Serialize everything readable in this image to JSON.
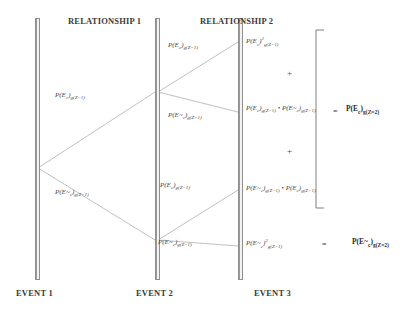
{
  "diagram": {
    "title_headers": [
      {
        "label": "RELATIONSHIP 1",
        "x": 68,
        "y": 16
      },
      {
        "label": "RELATIONSHIP 2",
        "x": 200,
        "y": 16
      }
    ],
    "footers": [
      {
        "label": "EVENT 1",
        "x": 16,
        "y": 288
      },
      {
        "label": "EVENT 2",
        "x": 136,
        "y": 288
      },
      {
        "label": "EVENT 3",
        "x": 254,
        "y": 288
      }
    ],
    "bars": [
      {
        "name": "event-1-bar",
        "x": 35,
        "y": 18,
        "height": 262
      },
      {
        "name": "event-2-bar",
        "x": 155,
        "y": 18,
        "height": 262
      },
      {
        "name": "event-3-bar",
        "x": 238,
        "y": 18,
        "height": 262
      }
    ],
    "branch_labels": [
      {
        "name": "branch-label-upper-rel1",
        "text_html": "P(E<sub>c</sub>)<sub>g(Z=1)</sub>",
        "x": 55,
        "y": 92
      },
      {
        "name": "branch-label-lower-rel1",
        "text_html": "P(E~<sub>c</sub>)<sub>g(Z=1)</sub>",
        "x": 55,
        "y": 189
      },
      {
        "name": "branch-label-upper-upper-rel2",
        "text_html": "P(E<sub>c</sub>)<sub>g(Z=1)</sub>",
        "x": 168,
        "y": 42
      },
      {
        "name": "branch-label-upper-lower-rel2",
        "text_html": "P(E~<sub>c</sub>)<sub>g(Z=1)</sub>",
        "x": 168,
        "y": 112
      },
      {
        "name": "branch-label-lower-upper-rel2",
        "text_html": "P(E<sub>c</sub>)<sub>g(Z=1)</sub>",
        "x": 160,
        "y": 182
      },
      {
        "name": "branch-label-lower-lower-rel2",
        "text_html": "P(E~<sub>c</sub>)<sub>g(Z=1)</sub>",
        "x": 158,
        "y": 239
      }
    ],
    "outcome_terms": [
      {
        "name": "outcome-term-1",
        "text_html": "P(E<sub>c</sub>)<sup>2</sup><sub>g(Z=1)</sub>",
        "x": 246,
        "y": 36
      },
      {
        "name": "outcome-term-2",
        "text_html": "P(E<sub>c</sub>)<sub>g(Z=1)</sub> &bull; P(E~<sub>c</sub>)<sub>g(Z=1)</sub>",
        "x": 246,
        "y": 105
      },
      {
        "name": "outcome-term-3",
        "text_html": "P(E~<sub>c</sub>)<sub>g(Z=1)</sub> &bull; P(E<sub>c</sub>)<sub>g(Z=1)</sub>",
        "x": 246,
        "y": 185
      },
      {
        "name": "outcome-term-4",
        "text_html": "P(E~<sub>c</sub>)<sup>2</sup><sub>g(Z=1)</sub>",
        "x": 246,
        "y": 238
      }
    ],
    "operators": [
      {
        "name": "plus-operator-1",
        "text": "+",
        "x": 287,
        "y": 68
      },
      {
        "name": "plus-operator-2",
        "text": "+",
        "x": 287,
        "y": 146
      },
      {
        "name": "equals-operator-1",
        "text": "=",
        "x": 333,
        "y": 107
      },
      {
        "name": "equals-operator-2",
        "text": "=",
        "x": 322,
        "y": 240
      }
    ],
    "results": [
      {
        "name": "result-ec-z2",
        "text_html": "P(E<sub>c</sub>)<sub>g(Z=2)</sub>",
        "x": 346,
        "y": 105
      },
      {
        "name": "result-enotc-z2",
        "text_html": "P(E~<sub>c</sub>)<sub>g(Z=2)</sub>",
        "x": 352,
        "y": 238
      }
    ],
    "bracket": {
      "name": "grouping-bracket",
      "x": 316,
      "y": 30,
      "height": 178,
      "arm": 8
    },
    "edges": [
      {
        "name": "edge-event1-to-event2-upper",
        "x1": 38,
        "y1": 168,
        "x2": 155,
        "y2": 92
      },
      {
        "name": "edge-event1-to-event2-lower",
        "x1": 38,
        "y1": 168,
        "x2": 155,
        "y2": 240
      },
      {
        "name": "edge-event2-to-event3-upper-upper",
        "x1": 158,
        "y1": 92,
        "x2": 238,
        "y2": 42
      },
      {
        "name": "edge-event2-to-event3-upper-lower",
        "x1": 158,
        "y1": 92,
        "x2": 238,
        "y2": 112
      },
      {
        "name": "edge-event2-to-event3-lower-upper",
        "x1": 158,
        "y1": 240,
        "x2": 238,
        "y2": 190
      },
      {
        "name": "edge-event2-to-event3-lower-lower",
        "x1": 158,
        "y1": 240,
        "x2": 238,
        "y2": 246
      }
    ],
    "colors": {
      "line": "#b9b9b9",
      "text": "#3a3a3a",
      "bar": "#b4b4b4"
    }
  }
}
